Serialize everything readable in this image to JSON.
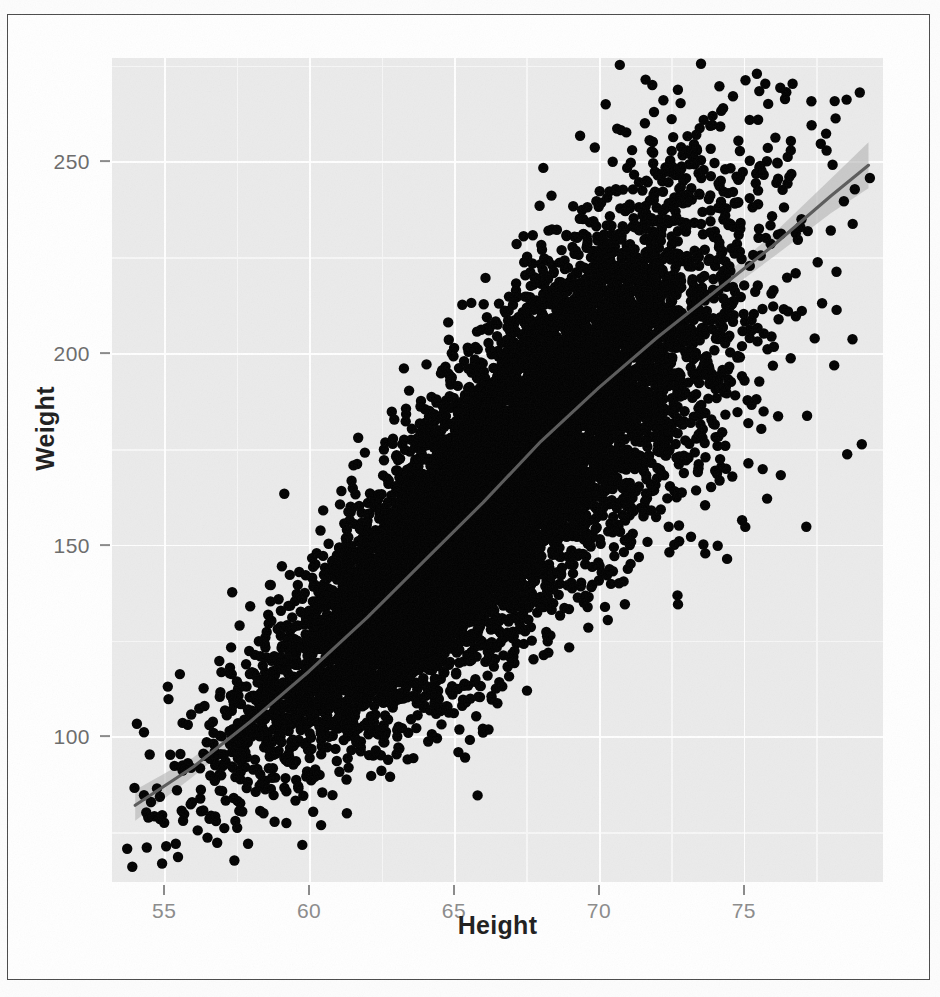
{
  "figure": {
    "panel_background_color": "#ebebeb",
    "gridline_color": "#ffffff",
    "point_color": "#000000",
    "smooth_line_color": "#5f7fa0",
    "smooth_band_color": "#b9b9b9"
  },
  "chart_data": {
    "type": "scatter",
    "title": "",
    "subtitle": "",
    "xlabel": "Height",
    "ylabel": "Weight",
    "xlim": [
      53.2,
      79.8
    ],
    "ylim": [
      62,
      277
    ],
    "grid": true,
    "legend": "none",
    "x_ticks": [
      55,
      60,
      65,
      70,
      75
    ],
    "y_ticks": [
      100,
      150,
      200,
      250
    ],
    "x_tick_labels": [
      "55",
      "60",
      "65",
      "70",
      "75"
    ],
    "y_tick_labels": [
      "100",
      "150",
      "200",
      "250"
    ],
    "x_minor_ticks": [
      57.5,
      62.5,
      67.5,
      72.5,
      77.5
    ],
    "y_minor_ticks": [
      75,
      125,
      175,
      225,
      275
    ],
    "n_points": 9000,
    "point_size": 5.2,
    "annotations": [],
    "series": [
      {
        "name": "observations",
        "type": "scatter",
        "description": "Height (inches) versus Weight (pounds), strong positive correlation, dense overplotted cloud",
        "x_mean": 66.4,
        "y_mean": 162.0,
        "x_sd": 4.0,
        "y_sd": 33.0,
        "correlation": 0.86,
        "outliers": [
          {
            "x": 79.0,
            "y": 268
          },
          {
            "x": 78.0,
            "y": 232
          },
          {
            "x": 77.7,
            "y": 213
          },
          {
            "x": 77.0,
            "y": 211
          },
          {
            "x": 63.0,
            "y": 173
          },
          {
            "x": 64.8,
            "y": 208
          },
          {
            "x": 66.0,
            "y": 101
          },
          {
            "x": 63.4,
            "y": 94
          },
          {
            "x": 54.4,
            "y": 71
          },
          {
            "x": 53.9,
            "y": 66
          },
          {
            "x": 55.4,
            "y": 72
          }
        ]
      },
      {
        "name": "loess-smooth",
        "type": "line",
        "description": "LOESS smoother with 95% confidence ribbon",
        "x": [
          54.0,
          56.0,
          58.0,
          60.0,
          62.0,
          64.0,
          66.0,
          68.0,
          70.0,
          72.0,
          74.0,
          76.0,
          78.0,
          79.3
        ],
        "y": [
          82.0,
          92.0,
          104.0,
          117.0,
          131.0,
          146.0,
          161.0,
          177.0,
          191.0,
          204.0,
          216.0,
          228.0,
          241.0,
          249.0
        ],
        "ci_lower": [
          78.0,
          89.5,
          102.0,
          115.5,
          129.8,
          144.8,
          160.0,
          176.0,
          189.8,
          202.4,
          213.8,
          225.0,
          236.5,
          243.0
        ],
        "ci_upper": [
          86.0,
          94.5,
          106.0,
          118.5,
          132.2,
          147.2,
          162.0,
          178.0,
          192.2,
          205.6,
          218.2,
          231.0,
          245.5,
          255.0
        ]
      }
    ]
  }
}
